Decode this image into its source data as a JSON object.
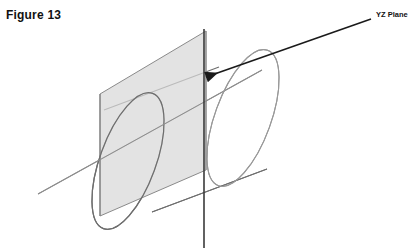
{
  "figure": {
    "title": "Figure 13",
    "caption_position": "top-left"
  },
  "annotations": [
    {
      "id": "yz-plane",
      "label": "YZ Plane",
      "leader_from": [
        371,
        19
      ],
      "leader_to": [
        206,
        77
      ],
      "arrow": true
    }
  ],
  "colors": {
    "background": "#ffffff",
    "outline": "#6e6e6e",
    "outline_dark": "#3d3d3d",
    "plane_fill": "#d8d8d8",
    "plane_edge": "#8a8a8a",
    "trace_line": "#3a3a3a",
    "text": "#111111",
    "arrow": "#1a1a1a"
  },
  "geometry": {
    "description": "A tilted circular cylinder intersected by a vertical YZ plane; the plane appears as a shaded parallelogram and its trace is a dark vertical line.",
    "cylinder": {
      "left_ellipse_center": [
        128,
        161
      ],
      "right_ellipse_center": [
        243,
        118
      ],
      "ellipse_rx": 28,
      "ellipse_ry": 72,
      "ellipse_rotation_deg": 20,
      "axis_line_from": [
        38,
        194
      ],
      "axis_line_to": [
        262,
        70
      ]
    },
    "plane": {
      "shape": "parallelogram",
      "corners": [
        [
          100,
          94
        ],
        [
          206,
          31
        ],
        [
          206,
          170
        ],
        [
          100,
          216
        ]
      ],
      "fill": "#d8d8d8",
      "opacity": 0.72
    },
    "vertical_trace": {
      "x": 204,
      "y_top": 29,
      "y_bottom": 248
    }
  },
  "icons": {
    "arrowhead": "arrow-left-icon"
  }
}
